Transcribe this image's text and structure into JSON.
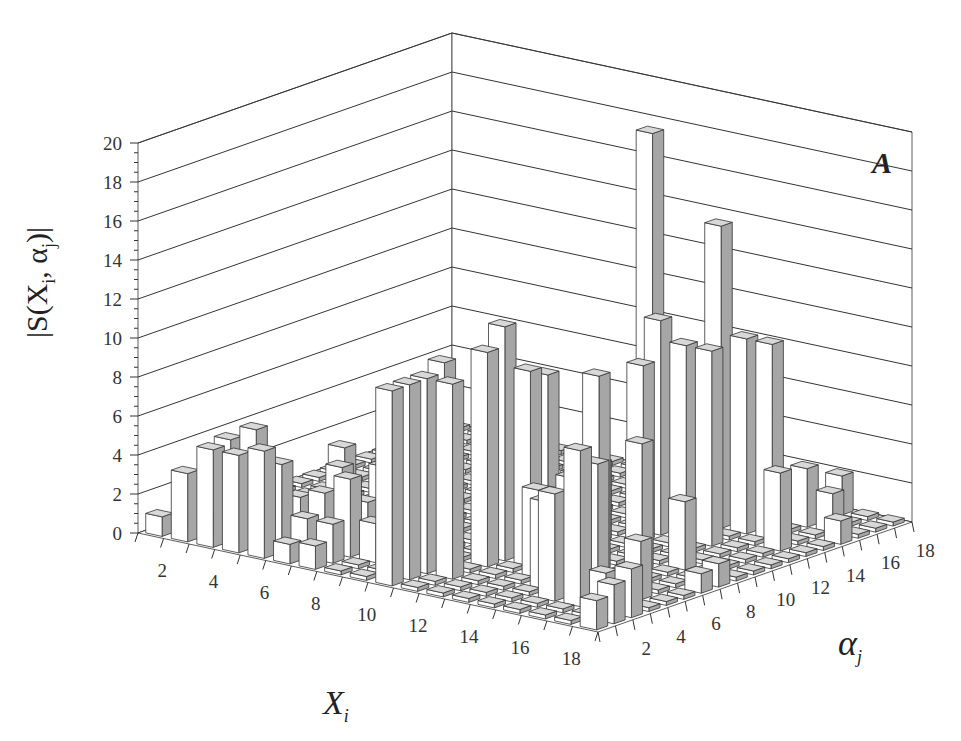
{
  "chart_data": {
    "type": "bar3d",
    "panel_label": "A",
    "title": "",
    "zlabel": "|S(X_i, α_j)|",
    "xlabel": "X_i",
    "ylabel": "α_j",
    "zlim": [
      0,
      20
    ],
    "z_ticks": [
      0,
      2,
      4,
      6,
      8,
      10,
      12,
      14,
      16,
      18,
      20
    ],
    "x_ticks": [
      2,
      4,
      6,
      8,
      10,
      12,
      14,
      16,
      18
    ],
    "y_ticks": [
      2,
      4,
      6,
      8,
      10,
      12,
      14,
      16,
      18
    ],
    "grid": true,
    "n_x": 18,
    "n_y": 18,
    "bars": [
      {
        "x": 1,
        "y": 1,
        "z": 1.0
      },
      {
        "x": 2,
        "y": 1,
        "z": 3.5
      },
      {
        "x": 3,
        "y": 1,
        "z": 5.0
      },
      {
        "x": 4,
        "y": 1,
        "z": 5.0
      },
      {
        "x": 5,
        "y": 1,
        "z": 5.5
      },
      {
        "x": 6,
        "y": 1,
        "z": 1.0
      },
      {
        "x": 7,
        "y": 1,
        "z": 1.2
      },
      {
        "x": 3,
        "y": 2,
        "z": 5.2
      },
      {
        "x": 4,
        "y": 2,
        "z": 6.0
      },
      {
        "x": 5,
        "y": 2,
        "z": 4.5
      },
      {
        "x": 6,
        "y": 2,
        "z": 2.0
      },
      {
        "x": 7,
        "y": 2,
        "z": 2.0
      },
      {
        "x": 6,
        "y": 3,
        "z": 3.0
      },
      {
        "x": 7,
        "y": 3,
        "z": 4.0
      },
      {
        "x": 8,
        "y": 3,
        "z": 2.0
      },
      {
        "x": 6,
        "y": 4,
        "z": 4.0
      },
      {
        "x": 7,
        "y": 4,
        "z": 2.5
      },
      {
        "x": 8,
        "y": 4,
        "z": 3.0
      },
      {
        "x": 9,
        "y": 4,
        "z": 2.5
      },
      {
        "x": 7,
        "y": 5,
        "z": 4.0
      },
      {
        "x": 8,
        "y": 5,
        "z": 3.5
      },
      {
        "x": 9,
        "y": 5,
        "z": 3.0
      },
      {
        "x": 10,
        "y": 1,
        "z": 10.0
      },
      {
        "x": 10,
        "y": 2,
        "z": 10.0
      },
      {
        "x": 10,
        "y": 3,
        "z": 10.0
      },
      {
        "x": 11,
        "y": 3,
        "z": 10.0
      },
      {
        "x": 10,
        "y": 4,
        "z": 10.5
      },
      {
        "x": 11,
        "y": 5,
        "z": 11.0
      },
      {
        "x": 11,
        "y": 6,
        "z": 12.0
      },
      {
        "x": 12,
        "y": 6,
        "z": 10.0
      },
      {
        "x": 12,
        "y": 7,
        "z": 9.5
      },
      {
        "x": 13,
        "y": 5,
        "z": 4.5
      },
      {
        "x": 13,
        "y": 6,
        "z": 4.0
      },
      {
        "x": 14,
        "y": 4,
        "z": 4.5
      },
      {
        "x": 14,
        "y": 5,
        "z": 4.0
      },
      {
        "x": 15,
        "y": 3,
        "z": 5.5
      },
      {
        "x": 15,
        "y": 4,
        "z": 6.0
      },
      {
        "x": 16,
        "y": 3,
        "z": 8.0
      },
      {
        "x": 16,
        "y": 4,
        "z": 7.0
      },
      {
        "x": 17,
        "y": 3,
        "z": 2.0
      },
      {
        "x": 14,
        "y": 7,
        "z": 10.0
      },
      {
        "x": 15,
        "y": 8,
        "z": 6.5
      },
      {
        "x": 16,
        "y": 9,
        "z": 3.5
      },
      {
        "x": 12,
        "y": 10,
        "z": 4.0
      },
      {
        "x": 13,
        "y": 11,
        "z": 9.0
      },
      {
        "x": 13,
        "y": 12,
        "z": 11.0
      },
      {
        "x": 12,
        "y": 13,
        "z": 20.0
      },
      {
        "x": 14,
        "y": 12,
        "z": 10.0
      },
      {
        "x": 15,
        "y": 12,
        "z": 10.0
      },
      {
        "x": 14,
        "y": 14,
        "z": 15.5
      },
      {
        "x": 15,
        "y": 14,
        "z": 10.0
      },
      {
        "x": 16,
        "y": 14,
        "z": 10.0
      },
      {
        "x": 17,
        "y": 13,
        "z": 4.0
      },
      {
        "x": 16,
        "y": 16,
        "z": 3.0
      },
      {
        "x": 17,
        "y": 16,
        "z": 2.0
      },
      {
        "x": 18,
        "y": 1,
        "z": 1.5
      },
      {
        "x": 18,
        "y": 2,
        "z": 2.0
      },
      {
        "x": 18,
        "y": 3,
        "z": 2.5
      },
      {
        "x": 17,
        "y": 5,
        "z": 3.0
      },
      {
        "x": 18,
        "y": 7,
        "z": 1.0
      },
      {
        "x": 18,
        "y": 8,
        "z": 1.2
      },
      {
        "x": 18,
        "y": 15,
        "z": 1.2
      },
      {
        "x": 16,
        "y": 18,
        "z": 2.0
      },
      {
        "x": 9,
        "y": 11,
        "z": 3.0
      },
      {
        "x": 8,
        "y": 13,
        "z": 1.0
      },
      {
        "x": 10,
        "y": 12,
        "z": 1.0
      },
      {
        "x": 3,
        "y": 6,
        "z": 1.0
      },
      {
        "x": 2,
        "y": 10,
        "z": 2.0
      }
    ]
  },
  "labels": {
    "panel": "A",
    "zaxis_pre": "|S(X",
    "zaxis_i": "i",
    "zaxis_mid": ", α",
    "zaxis_j": "j",
    "zaxis_post": ")|",
    "xaxis_main": "X",
    "xaxis_sub": "i",
    "yaxis_main": "α",
    "yaxis_sub": "j"
  },
  "style": {
    "bar_front": "#ffffff",
    "bar_side": "#a6a6a6",
    "bar_top": "#d8d8d8",
    "line": "#333333"
  }
}
